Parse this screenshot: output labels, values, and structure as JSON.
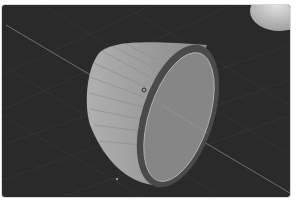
{
  "viewport": {
    "name": "3D Viewport",
    "background_color": "#2a2a2a",
    "grid_color": "#3a3a3a",
    "axis_line_color": "#6e6e6e",
    "objects": [
      {
        "name": "Cone",
        "type": "mesh",
        "selected": false,
        "side_color": "#9a9a9a",
        "face_color": "#858585",
        "rim_color": "#4a4a4a"
      },
      {
        "name": "Sphere",
        "type": "mesh",
        "partially_visible": true,
        "color": "#cfcfcf"
      }
    ],
    "origin_marker": "object-origin-icon",
    "cursor_marker": "3d-cursor-icon"
  }
}
